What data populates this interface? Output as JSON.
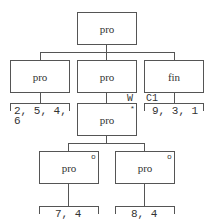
{
  "diagram": {
    "root": {
      "label": "pro"
    },
    "level2": [
      {
        "label": "pro",
        "list": [
          "2, 5, 4,",
          "6"
        ]
      },
      {
        "label": "pro",
        "edge_label": "W"
      },
      {
        "label": "fin",
        "edge_label": "C1",
        "list": [
          "9, 3, 1"
        ]
      }
    ],
    "level3": {
      "node": {
        "label": "pro",
        "mark": "*"
      }
    },
    "level4": [
      {
        "label": "pro",
        "mark": "o",
        "list": [
          "7, 4"
        ]
      },
      {
        "label": "pro",
        "mark": "o",
        "list": [
          "8, 4"
        ]
      }
    ]
  }
}
